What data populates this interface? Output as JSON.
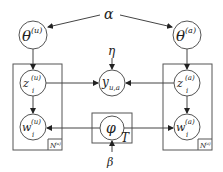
{
  "diagram": {
    "type": "plate-notation graphical model",
    "hyperparameters": {
      "alpha": "α",
      "eta": "η",
      "beta": "β"
    },
    "nodes": {
      "theta_u": {
        "base": "θ",
        "sup": "(u)"
      },
      "theta_a": {
        "base": "θ",
        "sup": "(a)"
      },
      "z_u": {
        "base": "z",
        "sup": "(u)",
        "sub": "i"
      },
      "w_u": {
        "base": "w",
        "sup": "(u)",
        "sub": "i"
      },
      "z_a": {
        "base": "z",
        "sup": "(a)",
        "sub": "i"
      },
      "w_a": {
        "base": "w",
        "sup": "(a)",
        "sub": "i"
      },
      "y": {
        "base": "y",
        "sub": "u,a"
      },
      "phi": {
        "base": "φ"
      }
    },
    "plates": {
      "left": {
        "label": "N",
        "sup": "(u)"
      },
      "right": {
        "label": "N",
        "sup": "(a)"
      },
      "topics": {
        "label": "T"
      }
    },
    "edges": [
      [
        "alpha",
        "theta_u"
      ],
      [
        "alpha",
        "theta_a"
      ],
      [
        "theta_u",
        "z_u"
      ],
      [
        "theta_a",
        "z_a"
      ],
      [
        "z_u",
        "w_u"
      ],
      [
        "z_a",
        "w_a"
      ],
      [
        "z_u",
        "y"
      ],
      [
        "z_a",
        "y"
      ],
      [
        "eta",
        "y"
      ],
      [
        "phi",
        "w_u"
      ],
      [
        "phi",
        "w_a"
      ],
      [
        "beta",
        "phi"
      ]
    ]
  }
}
